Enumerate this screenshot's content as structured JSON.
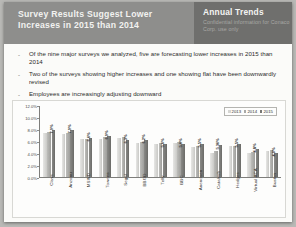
{
  "slide": {
    "header": {
      "title": "Survey Results Suggest Lower Increases in 2015 than 2014",
      "section_title": "Annual Trends",
      "confidential_note": "Confidential information for Conaco Corp. use only"
    },
    "bullets": [
      "Of the nine major surveys we analyzed, five are forecasting lower increases in 2015 than 2014",
      "Two of the surveys showing higher increases and one showing flat have been downwardly revised",
      "Employees are increasingly adjusting downward"
    ],
    "bullet_marker": "-"
  },
  "chart_data": {
    "type": "bar",
    "title": "",
    "xlabel": "",
    "ylabel": "",
    "ylim": [
      0,
      12
    ],
    "grid": false,
    "legend_position": "top-right",
    "ytick_labels": [
      "12.0%",
      "10.0%",
      "8.0%",
      "6.0%",
      "4.0%",
      "2.0%",
      "0.0%"
    ],
    "ytick_values": [
      12,
      10,
      8,
      6,
      4,
      2,
      0
    ],
    "categories": [
      "Clays",
      "Anzonu",
      "MSWD",
      "Towens",
      "Segal",
      "BBGD",
      "Telly",
      "BBC",
      "Anenosen",
      "Catalysb",
      "Hedges",
      "Virtual ACA",
      "Buston"
    ],
    "series": [
      {
        "name": "2013",
        "values": [
          7.4,
          7.2,
          6.4,
          6.5,
          6.6,
          5.8,
          5.6,
          5.7,
          5.1,
          4.1,
          5.2,
          4.1,
          4.4
        ]
      },
      {
        "name": "2014",
        "values": [
          7.6,
          7.4,
          6.5,
          6.7,
          6.8,
          6.0,
          5.8,
          5.9,
          5.3,
          4.4,
          5.3,
          4.3,
          4.6
        ]
      },
      {
        "name": "2015",
        "values": [
          7.9,
          7.9,
          6.6,
          6.9,
          6.3,
          6.2,
          5.6,
          5.6,
          5.5,
          5.36,
          5.5,
          4.8,
          4.0
        ]
      }
    ],
    "value_labels": [
      "7.9%",
      "7.9%",
      "6.6%",
      "6.9%",
      "6.3%",
      "6.2%",
      "5.6%",
      "5.6%",
      "5.5%",
      "5.36%",
      "5.5%",
      "4.8%",
      "4.0%"
    ]
  }
}
